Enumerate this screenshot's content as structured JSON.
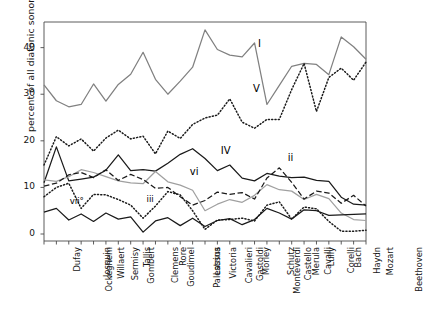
{
  "chart_data": {
    "type": "line",
    "title": "",
    "xlabel": "",
    "ylabel": "percent of all diatonic sonorities",
    "ylim": [
      -1.5,
      45.5
    ],
    "yticks": [
      0,
      10,
      20,
      30,
      40
    ],
    "ytick_labels": [
      "0",
      "10",
      "20",
      "30",
      "40"
    ],
    "grid": false,
    "legend": "inline-curve-labels",
    "categories": [
      "Dufay",
      "Ockeghem",
      "Josquin",
      "Willaert",
      "Sermisy",
      "Gombert",
      "Tallis",
      "Clemens",
      "Goudimel",
      "Rore",
      "Palestrina",
      "Lassus",
      "Victoria",
      "Cavalieri",
      "Gastoldi",
      "Morley",
      "Monteverdi",
      "Schutz",
      "Castello",
      "Merula",
      "Cavalli",
      "Lully",
      "Corelli",
      "Bach",
      "Haydn",
      "Mozart",
      "Beethoven"
    ],
    "series": [
      {
        "name": "I",
        "style": "solid",
        "color": "#808080",
        "label_x_index": 17.6,
        "label_y": 40.6,
        "values": [
          32.0,
          28.6,
          27.3,
          27.8,
          32.2,
          28.5,
          32.1,
          34.3,
          39.0,
          33.2,
          30.0,
          32.8,
          35.8,
          43.8,
          39.6,
          38.4,
          38.0,
          41.0,
          27.8,
          31.9,
          36.0,
          36.6,
          36.4,
          34.2,
          42.3,
          40.2,
          37.5
        ]
      },
      {
        "name": "V",
        "style": "dotted",
        "color": "#1a1a1a",
        "label_x_index": 17.2,
        "label_y": 31.0,
        "values": [
          14.8,
          20.9,
          18.9,
          20.4,
          17.8,
          20.6,
          22.3,
          20.4,
          21.0,
          17.2,
          22.1,
          20.5,
          23.5,
          24.9,
          25.5,
          29.0,
          24.0,
          22.7,
          24.6,
          24.6,
          31.0,
          36.6,
          26.3,
          33.6,
          35.6,
          33.0,
          36.9
        ]
      },
      {
        "name": "IV",
        "style": "solid",
        "color": "#1a1a1a",
        "label_x_index": 14.6,
        "label_y": 17.6,
        "values": [
          11.0,
          18.7,
          11.4,
          11.8,
          12.2,
          13.7,
          17.0,
          13.6,
          13.8,
          13.5,
          15.2,
          17.1,
          18.3,
          16.2,
          13.6,
          14.8,
          12.0,
          11.4,
          13.0,
          12.4,
          12.1,
          12.2,
          11.5,
          11.3,
          7.9,
          6.4,
          6.2
        ]
      },
      {
        "name": "vi",
        "style": "solid",
        "color": "#a0a0a0",
        "label_x_index": 12.1,
        "label_y": 13.2,
        "values": [
          11.6,
          11.3,
          12.3,
          13.8,
          13.2,
          12.3,
          11.4,
          11.0,
          10.8,
          13.4,
          11.2,
          10.5,
          9.4,
          5.0,
          6.4,
          7.4,
          6.8,
          8.3,
          10.6,
          9.5,
          9.2,
          7.4,
          8.5,
          7.6,
          4.5,
          3.1,
          2.9
        ]
      },
      {
        "name": "ii",
        "style": "dashed",
        "color": "#1a1a1a",
        "label_x_index": 20.0,
        "label_y": 16.1,
        "values": [
          10.3,
          10.9,
          12.7,
          13.2,
          12.1,
          13.8,
          11.5,
          12.8,
          11.7,
          9.8,
          10.0,
          8.0,
          6.2,
          7.2,
          9.0,
          8.5,
          8.9,
          7.5,
          12.0,
          14.2,
          11.1,
          7.5,
          9.2,
          8.8,
          6.6,
          8.3,
          6.0
        ]
      },
      {
        "name": "iii",
        "style": "dotted",
        "color": "#1a1a1a",
        "label_x_index": 8.6,
        "label_y": 7.0,
        "values": [
          8.0,
          10.0,
          10.9,
          5.5,
          8.5,
          8.4,
          7.4,
          6.2,
          3.4,
          6.0,
          9.1,
          8.4,
          5.0,
          1.0,
          3.0,
          3.1,
          3.4,
          2.8,
          6.2,
          6.9,
          3.2,
          5.8,
          5.4,
          2.7,
          0.6,
          0.6,
          0.8
        ]
      },
      {
        "name": "vii°",
        "style": "solid",
        "color": "#1a1a1a",
        "label_x_index": 2.4,
        "label_y": 6.7,
        "values": [
          4.7,
          5.5,
          3.0,
          4.3,
          2.7,
          4.5,
          3.2,
          3.7,
          0.4,
          2.8,
          3.5,
          1.8,
          3.4,
          1.6,
          2.9,
          3.3,
          2.0,
          3.1,
          5.5,
          4.5,
          3.2,
          5.2,
          5.0,
          4.0,
          4.1,
          4.2,
          4.3
        ]
      }
    ]
  }
}
